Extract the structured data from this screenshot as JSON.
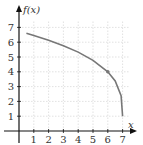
{
  "chart_data": {
    "type": "line",
    "title": "",
    "xlabel": "x",
    "ylabel": "f(x)",
    "xlim": [
      0,
      7.5
    ],
    "ylim": [
      0,
      7.5
    ],
    "x_ticks": [
      "1",
      "2",
      "3",
      "4",
      "5",
      "6",
      "7"
    ],
    "y_ticks": [
      "1",
      "2",
      "3",
      "4",
      "5",
      "6",
      "7"
    ],
    "grid": true,
    "series": [
      {
        "name": "f(x)",
        "x": [
          0.5,
          1,
          2,
          3,
          4,
          5,
          6,
          6.5,
          6.9,
          7
        ],
        "values": [
          6.6,
          6.45,
          6.13,
          5.76,
          5.33,
          4.78,
          4.0,
          3.38,
          2.39,
          1.0
        ]
      }
    ],
    "annotations": [
      {
        "type": "point",
        "x": 6,
        "y": 4
      }
    ],
    "colors": {
      "curve": "#777777",
      "grid": "#cccccc",
      "axis": "#111111"
    }
  }
}
